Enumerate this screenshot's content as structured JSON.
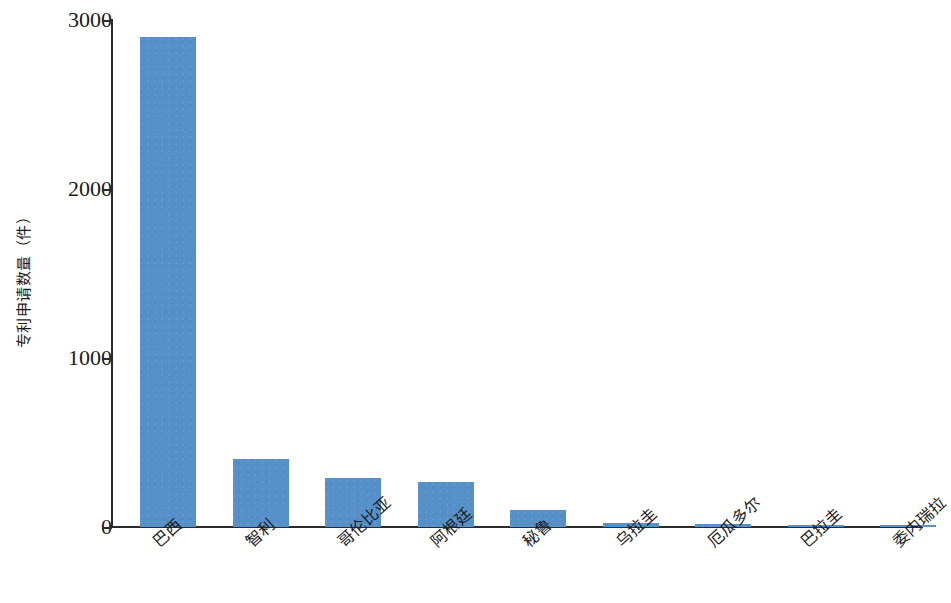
{
  "chart_data": {
    "type": "bar",
    "title": "",
    "subtitle": "",
    "xlabel": "",
    "ylabel": "专利申请数量（件）",
    "categories": [
      "巴西",
      "智利",
      "哥伦比亚",
      "阿根廷",
      "秘鲁",
      "乌拉圭",
      "厄瓜多尔",
      "巴拉圭",
      "委内瑞拉"
    ],
    "values": [
      2900,
      400,
      290,
      265,
      100,
      25,
      15,
      5,
      2
    ],
    "ylim": [
      0,
      3000
    ],
    "ytick_labels": [
      "3000",
      "2000",
      "1000",
      "0"
    ],
    "ytick_values": [
      3000,
      2000,
      1000,
      0
    ],
    "grid": false,
    "legend": null,
    "series_color": "#5590c8",
    "axis_color": "#2b2b2b",
    "background_color": "#ffffff"
  },
  "axis": {
    "y_title": "专利申请数量（件）"
  }
}
